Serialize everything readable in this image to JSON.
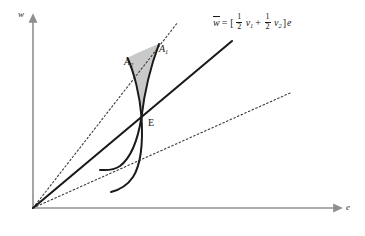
{
  "figure": {
    "background_color": "#ffffff",
    "axes": {
      "x_label": "e",
      "y_label": "w",
      "axis_color": "#8f8f8f",
      "origin": {
        "x": 33,
        "y": 208
      },
      "x_axis_end": {
        "x": 341,
        "y": 208
      },
      "y_axis_top": {
        "x": 33,
        "y": 18
      }
    },
    "equilibrium": {
      "label": "E",
      "label_x": 148,
      "label_y": 118,
      "point_x": 141,
      "point_y": 118
    },
    "points": [
      {
        "name": "A1",
        "label": "A",
        "subscript": "1",
        "x": 159,
        "y": 44
      },
      {
        "name": "A2",
        "label": "A",
        "subscript": "2",
        "x": 124,
        "y": 57
      }
    ],
    "formula": {
      "lhs": "w",
      "lhs_overline": true,
      "equals": "=",
      "open_bracket": "[",
      "frac1_num": "1",
      "frac1_den": "2",
      "var1": "v",
      "var1_sub": "1",
      "plus": "+",
      "frac2_num": "1",
      "frac2_den": "2",
      "var2": "v",
      "var2_sub": "2",
      "close_bracket": "]",
      "rhs_var": "e"
    },
    "colors": {
      "curve": "#1a1a1a",
      "dotted_ray": "#3a3a3a",
      "shaded_region": "#c9c9c9",
      "shaded_region_stroke": "none",
      "axis": "#8f8f8f",
      "text": "#1a1a1a"
    },
    "geometry": {
      "ray_v1_dotted": {
        "from": [
          33,
          208
        ],
        "to": [
          178,
          22
        ],
        "style": "dotted",
        "note": "steep reservation-wage ray v1"
      },
      "ray_average_solid": {
        "from": [
          33,
          208
        ],
        "to": [
          232,
          41
        ],
        "style": "solid",
        "note": "average wage ray w-bar"
      },
      "ray_v2_dotted": {
        "from": [
          33,
          208
        ],
        "to": [
          290,
          93
        ],
        "style": "dotted",
        "note": "shallow reservation-wage ray v2"
      },
      "curve_1": {
        "points": [
          [
            159,
            44
          ],
          [
            147,
            88
          ],
          [
            141,
            118
          ],
          [
            125,
            150
          ],
          [
            100,
            170
          ]
        ],
        "style": "solid",
        "note": "effort supply curve through A1 and E"
      },
      "curve_2": {
        "points": [
          [
            127,
            58
          ],
          [
            136,
            95
          ],
          [
            141,
            118
          ],
          [
            137,
            160
          ],
          [
            111,
            192
          ]
        ],
        "style": "solid",
        "note": "effort supply curve through A2 and E"
      },
      "shaded_lens": {
        "vertices": [
          [
            159,
            44
          ],
          [
            127,
            58
          ],
          [
            141,
            118
          ]
        ],
        "note": "grey lens between the two curves above E"
      }
    }
  }
}
